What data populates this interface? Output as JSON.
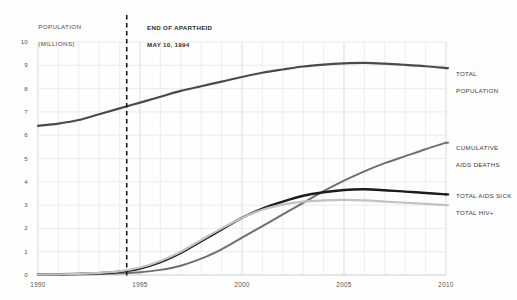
{
  "chart_data": {
    "type": "line",
    "title": "",
    "subtitle": "",
    "xlabel": "",
    "ylabel": "POPULATION\n(MILLIONS)",
    "ylabel_line1": "POPULATION",
    "ylabel_line2": "(MILLIONS)",
    "xlim": [
      1990,
      2010
    ],
    "ylim": [
      0,
      10
    ],
    "grid": true,
    "legend_position": "right-inline",
    "x_ticks": [
      1990,
      1995,
      2000,
      2005,
      2010
    ],
    "x_tick_labels": [
      "1990",
      "1995",
      "2000",
      "2005",
      "2010"
    ],
    "y_ticks": [
      0,
      1,
      2,
      3,
      4,
      5,
      6,
      7,
      8,
      9,
      10
    ],
    "y_tick_labels": [
      "0",
      "1",
      "2",
      "3",
      "4",
      "5",
      "6",
      "7",
      "8",
      "9",
      "10"
    ],
    "x": [
      1990,
      1991,
      1992,
      1993,
      1994,
      1995,
      1996,
      1997,
      1998,
      1999,
      2000,
      2001,
      2002,
      2003,
      2004,
      2005,
      2006,
      2007,
      2008,
      2009,
      2010
    ],
    "series": [
      {
        "name": "TOTAL POPULATION",
        "label_line1": "TOTAL",
        "label_line2": "POPULATION",
        "color": "#4a4a4a",
        "width": 2.2,
        "values": [
          6.4,
          6.5,
          6.65,
          6.9,
          7.15,
          7.4,
          7.65,
          7.9,
          8.1,
          8.3,
          8.5,
          8.68,
          8.82,
          8.95,
          9.03,
          9.08,
          9.1,
          9.07,
          9.02,
          8.96,
          8.88
        ]
      },
      {
        "name": "CUMULATIVE AIDS DEATHS",
        "label_line1": "CUMULATIVE",
        "label_line2": "AIDS DEATHS",
        "color": "#6f6f6f",
        "width": 2.0,
        "values": [
          0.0,
          0.01,
          0.02,
          0.04,
          0.07,
          0.12,
          0.22,
          0.4,
          0.7,
          1.1,
          1.6,
          2.1,
          2.6,
          3.1,
          3.6,
          4.05,
          4.45,
          4.8,
          5.1,
          5.4,
          5.68
        ]
      },
      {
        "name": "TOTAL AIDS SICK",
        "label_line1": "TOTAL AIDS SICK",
        "label_line2": "",
        "color": "#1c1c1c",
        "width": 2.4,
        "values": [
          0.02,
          0.03,
          0.05,
          0.08,
          0.14,
          0.28,
          0.55,
          0.95,
          1.45,
          1.95,
          2.45,
          2.85,
          3.15,
          3.4,
          3.55,
          3.65,
          3.68,
          3.64,
          3.58,
          3.52,
          3.46
        ]
      },
      {
        "name": "TOTAL HIV+",
        "label_line1": "TOTAL HIV+",
        "label_line2": "",
        "color": "#c2c2c2",
        "width": 2.2,
        "values": [
          0.02,
          0.03,
          0.05,
          0.09,
          0.16,
          0.32,
          0.6,
          1.0,
          1.5,
          2.0,
          2.45,
          2.8,
          3.02,
          3.15,
          3.2,
          3.22,
          3.2,
          3.15,
          3.1,
          3.05,
          3.0
        ]
      }
    ],
    "annotations": [
      {
        "id": "end-of-apartheid",
        "type": "vline",
        "x": 1994.35,
        "style": "dashed",
        "color": "#1a1a1a",
        "label_line1": "END OF APARTHEID",
        "label_line2": "MAY 10, 1994"
      }
    ],
    "colors": {
      "background": "#fefefe",
      "grid": "#e2e2e2",
      "axis_text": "#555555",
      "annotation": "#1a1a1a"
    }
  }
}
